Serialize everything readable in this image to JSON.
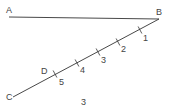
{
  "diagram": {
    "points": {
      "A": {
        "label": "A",
        "x": 9,
        "y": 17,
        "lx": 6,
        "ly": 13
      },
      "B": {
        "label": "B",
        "x": 159,
        "y": 19,
        "lx": 156,
        "ly": 15
      },
      "C": {
        "label": "C",
        "x": 13,
        "y": 97,
        "lx": 6,
        "ly": 100
      },
      "D": {
        "label": "D",
        "x": 55,
        "y": 74,
        "lx": 41,
        "ly": 74
      }
    },
    "segments": [
      {
        "from": "A",
        "to": "B"
      },
      {
        "from": "B",
        "to": "C"
      }
    ],
    "ticks": [
      {
        "label": "1",
        "x": 140,
        "y": 30,
        "lx": 143,
        "ly": 41
      },
      {
        "label": "2",
        "x": 118,
        "y": 42,
        "lx": 121,
        "ly": 52
      },
      {
        "label": "3",
        "x": 98,
        "y": 52,
        "lx": 101,
        "ly": 63
      },
      {
        "label": "4",
        "x": 77,
        "y": 63,
        "lx": 80,
        "ly": 73
      },
      {
        "label": "5",
        "x": 55,
        "y": 74,
        "lx": 59,
        "ly": 85
      }
    ],
    "figure_label": {
      "text": "3",
      "x": 81,
      "y": 105
    },
    "colors": {
      "stroke": "#333333",
      "text": "#444444",
      "background": "#ffffff"
    }
  }
}
